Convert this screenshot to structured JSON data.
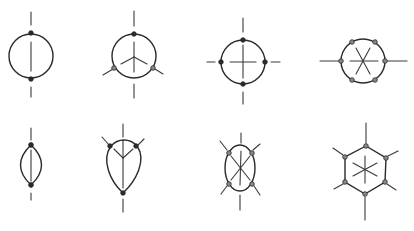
{
  "figure": {
    "stroke_color": "#2a2a2a",
    "background": "#ffffff"
  },
  "diagrams": [
    {
      "id": "d1",
      "row": 1,
      "col": 1,
      "shape": "circle",
      "nodes": 2,
      "inner_spokes": 1,
      "outer_bonds": 2
    },
    {
      "id": "d2",
      "row": 1,
      "col": 2,
      "shape": "circle",
      "nodes": 3,
      "inner_spokes": 3,
      "outer_bonds": 4
    },
    {
      "id": "d3",
      "row": 1,
      "col": 3,
      "shape": "circle",
      "nodes": 4,
      "inner_spokes": 4,
      "outer_bonds": 4
    },
    {
      "id": "d4",
      "row": 1,
      "col": 4,
      "shape": "circle",
      "nodes": 6,
      "inner_spokes": 6,
      "outer_bonds": 2
    },
    {
      "id": "d5",
      "row": 2,
      "col": 1,
      "shape": "lens",
      "nodes": 2,
      "inner_spokes": 1,
      "outer_bonds": 2
    },
    {
      "id": "d6",
      "row": 2,
      "col": 2,
      "shape": "teardrop",
      "nodes": 3,
      "inner_spokes": 3,
      "outer_bonds": 4
    },
    {
      "id": "d7",
      "row": 2,
      "col": 3,
      "shape": "ellipse",
      "nodes": 4,
      "inner_spokes": 6,
      "outer_bonds": 6
    },
    {
      "id": "d8",
      "row": 2,
      "col": 4,
      "shape": "hexagon",
      "nodes": 6,
      "inner_spokes": 6,
      "outer_bonds": 6
    }
  ]
}
